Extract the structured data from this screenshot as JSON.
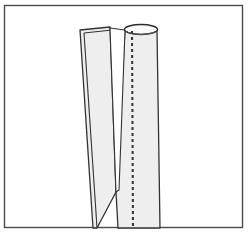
{
  "figure": {
    "title": "Split tube diagram",
    "description": "Line drawing of a cylindrical tube slit lengthwise, the left half peeled outward, with a dashed cut line down the right half",
    "background_color": "#ffffff",
    "frame": {
      "name": "border-frame",
      "x": 4.5,
      "y": 5.5,
      "width": 238,
      "height": 222,
      "stroke": "#4a4a4a",
      "stroke_width": 1.4,
      "fill": "none"
    },
    "shapes": {
      "left_strip": {
        "label": "peeled strip",
        "fill": "#eeeeee",
        "stroke": "#333333",
        "stroke_width": 1.3,
        "outline_points": "80,30 110,27 116,192 97,228 93,228"
      },
      "left_strip_inner_fold": {
        "label": "folded edge of strip",
        "stroke": "#333333",
        "stroke_width": 1.1,
        "points": "84,33 112,30"
      },
      "left_strip_inner_edge": {
        "label": "inner edge line of strip",
        "stroke": "#333333",
        "stroke_width": 1.1,
        "points": "84,33 97,228"
      },
      "right_tube": {
        "label": "tube body",
        "fill": "#eeeeee",
        "stroke": "#333333",
        "stroke_width": 1.3,
        "outline_points": "125,30 157,30 160,228 118,228 116,192"
      },
      "tube_top_ellipse": {
        "label": "open top of tube",
        "cx": 141,
        "cy": 29.5,
        "rx": 16.5,
        "ry": 5,
        "fill": "#fafafa",
        "stroke": "#2b2b2b",
        "stroke_width": 1.4
      },
      "tube_rim_inner": {
        "label": "inner rim of tube opening",
        "cx": 141,
        "cy": 31,
        "rx": 14,
        "ry": 3.4,
        "stroke": "#555555",
        "stroke_width": 1
      },
      "slit": {
        "label": "tapering slit between strip and tube",
        "fill": "#ffffff",
        "stroke": "#333333",
        "stroke_width": 1.1,
        "outline_points": "110,28 125,30 119,190 116,192"
      },
      "dashed_cut_line": {
        "label": "dashed cut-fold line",
        "x1": 132,
        "y1": 31,
        "x2": 133,
        "y2": 228,
        "stroke": "#3a3a3a",
        "stroke_width": 2.1,
        "dash_pattern": "3 3"
      }
    },
    "colors": {
      "paper_fill": "#eeeeee",
      "outline": "#333333",
      "frame_line": "#4a4a4a",
      "dash_line": "#3a3a3a",
      "page_background": "#ffffff"
    }
  }
}
